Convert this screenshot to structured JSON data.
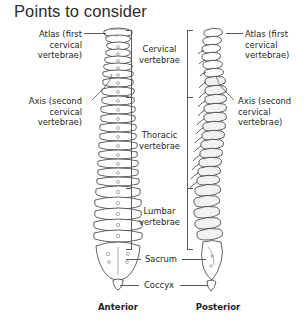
{
  "title": "Points to consider",
  "colors": {
    "background": "#ffffff",
    "text": "#231f20",
    "leader_line": "#58595b",
    "bone_outline": "#231f20",
    "bone_shade": "#f2f2f2"
  },
  "labels_left": [
    {
      "id": "atlas",
      "line1": "Atlas (first",
      "line2": "cervical",
      "line3": "vertebrae)"
    },
    {
      "id": "axis",
      "line1": "Axis (second",
      "line2": "cervical",
      "line3": "vertebrae)"
    }
  ],
  "labels_right": [
    {
      "id": "atlas",
      "line1": "Atlas (first",
      "line2": "cervical",
      "line3": "vertebrae)"
    },
    {
      "id": "axis",
      "line1": "Axis (second",
      "line2": "cervical",
      "line3": "vertebrae)"
    }
  ],
  "labels_center": [
    {
      "id": "cervical",
      "line1": "Cervical",
      "line2": "vertebrae"
    },
    {
      "id": "thoracic",
      "line1": "Thoracic",
      "line2": "vertebrae"
    },
    {
      "id": "lumbar",
      "line1": "Lumbar",
      "line2": "vertebrae"
    }
  ],
  "labels_lower": [
    {
      "id": "sacrum",
      "text": "Sacrum"
    },
    {
      "id": "coccyx",
      "text": "Coccyx"
    }
  ],
  "captions": [
    {
      "id": "anterior",
      "text": "Anterior"
    },
    {
      "id": "posterior",
      "text": "Posterior"
    }
  ],
  "icons": {
    "anterior_spine": "anterior-spine-illustration",
    "posterior_spine": "lateral-spine-illustration"
  }
}
